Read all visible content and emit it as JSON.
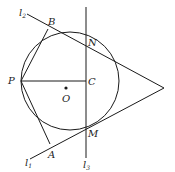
{
  "figure": {
    "points": {
      "P": {
        "label": "P",
        "x": 21,
        "y": 81
      },
      "B": {
        "label": "B",
        "x": 48,
        "y": 27
      },
      "A": {
        "label": "A",
        "x": 50,
        "y": 148
      },
      "N": {
        "label": "N",
        "x": 86,
        "y": 35
      },
      "M": {
        "label": "M",
        "x": 86,
        "y": 127
      },
      "C": {
        "label": "C",
        "x": 86,
        "y": 81
      },
      "O": {
        "label": "O",
        "x": 66,
        "y": 89
      },
      "apex": {
        "x": 164,
        "y": 88
      }
    },
    "circle": {
      "cx": 70,
      "cy": 81,
      "r": 49
    },
    "lines": {
      "l1": {
        "label": "l",
        "sub": "1"
      },
      "l2": {
        "label": "l",
        "sub": "2"
      },
      "l3": {
        "label": "l",
        "sub": "3"
      }
    },
    "line_color": "#1a1a1a"
  }
}
